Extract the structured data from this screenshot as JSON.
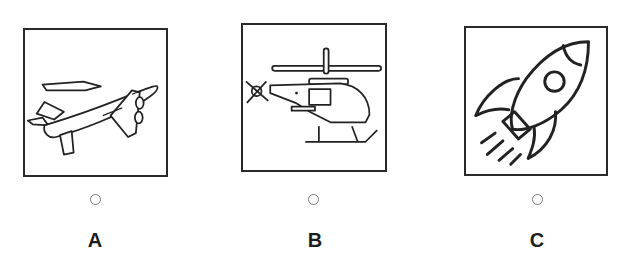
{
  "question": {
    "options": [
      {
        "letter": "A",
        "image": "airplane-icon",
        "selected": false
      },
      {
        "letter": "B",
        "image": "helicopter-icon",
        "selected": false
      },
      {
        "letter": "C",
        "image": "rocket-icon",
        "selected": false
      }
    ]
  }
}
